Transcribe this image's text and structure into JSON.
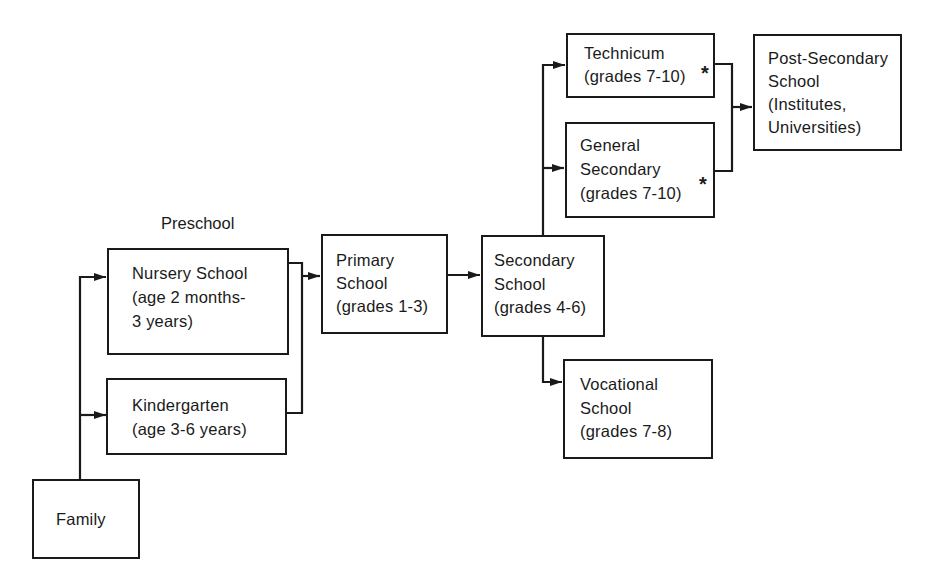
{
  "diagram": {
    "type": "flowchart",
    "group_label": "Preschool",
    "nodes": {
      "family": {
        "id": "family",
        "lines": [
          "Family"
        ]
      },
      "nursery": {
        "id": "nursery",
        "lines": [
          "Nursery School",
          "(age 2 months-",
          "3 years)"
        ]
      },
      "kindergarten": {
        "id": "kindergarten",
        "lines": [
          "Kindergarten",
          "(age 3-6 years)"
        ]
      },
      "primary": {
        "id": "primary",
        "lines": [
          "Primary",
          "School",
          "(grades 1-3)"
        ]
      },
      "secondary": {
        "id": "secondary",
        "lines": [
          "Secondary",
          "School",
          "(grades 4-6)"
        ]
      },
      "technicum": {
        "id": "technicum",
        "lines": [
          "Technicum",
          "(grades 7-10)"
        ],
        "footnote_mark": "*"
      },
      "general_secondary": {
        "id": "general_secondary",
        "lines": [
          "General",
          "Secondary",
          "(grades 7-10)"
        ],
        "footnote_mark": "*"
      },
      "post_secondary": {
        "id": "post_secondary",
        "lines": [
          "Post-Secondary",
          "School",
          "(Institutes,",
          "Universities)"
        ]
      },
      "vocational": {
        "id": "vocational",
        "lines": [
          "Vocational",
          "School",
          "(grades 7-8)"
        ]
      }
    },
    "edges": [
      {
        "from": "family",
        "to": "nursery"
      },
      {
        "from": "family",
        "to": "kindergarten"
      },
      {
        "from": "nursery",
        "to": "primary"
      },
      {
        "from": "kindergarten",
        "to": "primary"
      },
      {
        "from": "primary",
        "to": "secondary"
      },
      {
        "from": "secondary",
        "to": "technicum"
      },
      {
        "from": "secondary",
        "to": "general_secondary"
      },
      {
        "from": "secondary",
        "to": "vocational"
      },
      {
        "from": "technicum",
        "to": "post_secondary"
      },
      {
        "from": "general_secondary",
        "to": "post_secondary"
      }
    ],
    "colors": {
      "ink": "#1a1a1a",
      "background": "#ffffff"
    }
  }
}
